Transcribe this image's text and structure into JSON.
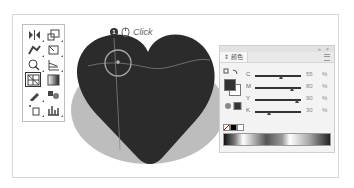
{
  "toolbox": {
    "tools": [
      {
        "name": "reflect-tool",
        "selected": false
      },
      {
        "name": "scale-tool",
        "selected": false
      },
      {
        "name": "puppet-warp-tool",
        "selected": false
      },
      {
        "name": "free-transform-tool",
        "selected": false
      },
      {
        "name": "shape-builder-tool",
        "selected": false
      },
      {
        "name": "perspective-grid-tool",
        "selected": false
      },
      {
        "name": "mesh-tool",
        "selected": true
      },
      {
        "name": "gradient-tool",
        "selected": false
      },
      {
        "name": "eyedropper-tool",
        "selected": false
      },
      {
        "name": "blend-tool",
        "selected": false
      },
      {
        "name": "symbol-sprayer-tool",
        "selected": false
      },
      {
        "name": "column-graph-tool",
        "selected": false
      }
    ]
  },
  "callout": {
    "step": "1",
    "label": "Click"
  },
  "color_panel": {
    "tab_label": "颜色",
    "sliders": [
      {
        "label": "C",
        "value": "55",
        "unit": "%"
      },
      {
        "label": "M",
        "value": "80",
        "unit": "%"
      },
      {
        "label": "Y",
        "value": "90",
        "unit": "%"
      },
      {
        "label": "K",
        "value": "30",
        "unit": "%"
      }
    ]
  },
  "colors": {
    "heart": "#2b2b2b",
    "shadow": "#bcbcbc",
    "accent_ring": "#a8a8a8"
  }
}
